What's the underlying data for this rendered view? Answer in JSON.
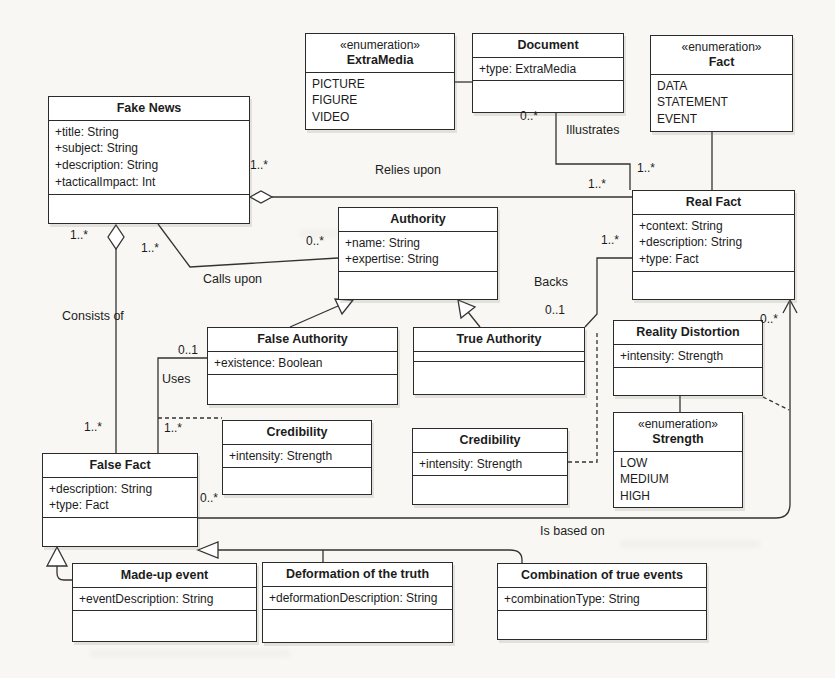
{
  "classes": {
    "fake_news": {
      "name": "Fake News",
      "attrs": [
        "+title: String",
        "+subject: String",
        "+description: String",
        "+tacticalImpact: Int"
      ]
    },
    "extra_media": {
      "stereotype": "«enumeration»",
      "name": "ExtraMedia",
      "literals": [
        "PICTURE",
        "FIGURE",
        "VIDEO"
      ]
    },
    "document": {
      "name": "Document",
      "attrs": [
        "+type: ExtraMedia"
      ]
    },
    "fact": {
      "stereotype": "«enumeration»",
      "name": "Fact",
      "literals": [
        "DATA",
        "STATEMENT",
        "EVENT"
      ]
    },
    "real_fact": {
      "name": "Real Fact",
      "attrs": [
        "+context: String",
        "+description: String",
        "+type: Fact"
      ]
    },
    "authority": {
      "name": "Authority",
      "attrs": [
        "+name: String",
        "+expertise: String"
      ]
    },
    "false_authority": {
      "name": "False Authority",
      "attrs": [
        "+existence: Boolean"
      ]
    },
    "true_authority": {
      "name": "True Authority"
    },
    "reality_distortion": {
      "name": "Reality Distortion",
      "attrs": [
        "+intensity: Strength"
      ]
    },
    "strength": {
      "stereotype": "«enumeration»",
      "name": "Strength",
      "literals": [
        "LOW",
        "MEDIUM",
        "HIGH"
      ]
    },
    "credibility_uses": {
      "name": "Credibility",
      "attrs": [
        "+intensity: Strength"
      ]
    },
    "credibility_backs": {
      "name": "Credibility",
      "attrs": [
        "+intensity: Strength"
      ]
    },
    "false_fact": {
      "name": "False Fact",
      "attrs": [
        "+description: String",
        "+type: Fact"
      ]
    },
    "made_up_event": {
      "name": "Made-up event",
      "attrs": [
        "+eventDescription: String"
      ]
    },
    "deformation": {
      "name": "Deformation of the truth",
      "attrs": [
        "+deformationDescription: String"
      ]
    },
    "combination": {
      "name": "Combination of true events",
      "attrs": [
        "+combinationType: String"
      ]
    }
  },
  "associations": {
    "relies_upon": {
      "label": "Relies upon",
      "src_mult": "1..*",
      "tgt_mult": "1..*"
    },
    "illustrates": {
      "label": "Illustrates",
      "src_mult": "0..*",
      "tgt_mult": "1..*"
    },
    "calls_upon": {
      "label": "Calls upon",
      "src_mult": "1..*",
      "tgt_mult": "0..*"
    },
    "consists_of": {
      "label": "Consists of",
      "src_mult": "1..*",
      "tgt_mult": "1..*"
    },
    "uses": {
      "label": "Uses",
      "src_mult": "1..*",
      "tgt_mult": "0..1"
    },
    "backs": {
      "label": "Backs",
      "src_mult": "0..1",
      "tgt_mult": "1..*"
    },
    "is_based_on": {
      "label": "Is based on",
      "src_mult": "0..*",
      "tgt_mult": "0..*"
    }
  },
  "colors": {
    "line": "#333333",
    "box_bg": "#ffffff",
    "page_bg": "#f8f7f3"
  }
}
